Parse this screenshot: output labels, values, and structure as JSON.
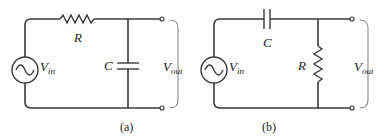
{
  "figure": {
    "panels": [
      {
        "id": "a",
        "caption": "(a)",
        "source_label": "V",
        "source_sub": "in",
        "series_label": "R",
        "shunt_label": "C",
        "output_label": "V",
        "output_sub": "out",
        "series_component": "resistor",
        "shunt_component": "capacitor",
        "type": "RC low-pass filter"
      },
      {
        "id": "b",
        "caption": "(b)",
        "source_label": "V",
        "source_sub": "in",
        "series_label": "C",
        "shunt_label": "R",
        "output_label": "V",
        "output_sub": "out",
        "series_component": "capacitor",
        "shunt_component": "resistor",
        "type": "RC high-pass filter"
      }
    ]
  }
}
